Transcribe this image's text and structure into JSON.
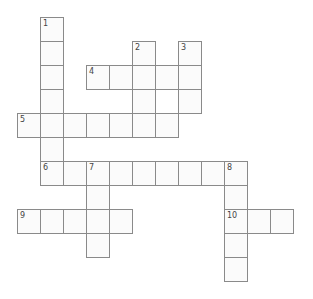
{
  "puzzle": {
    "type": "crossword",
    "cell_width": 23,
    "cell_height": 24,
    "origin_x": 17,
    "origin_y": 17,
    "colors": {
      "cell_fill": "#fbfbfb",
      "cell_border": "#8a8a8a",
      "number_text": "#444444",
      "background": "#ffffff"
    },
    "entries": [
      {
        "number": "1",
        "direction": "down",
        "row": 0,
        "col": 1,
        "length": 7
      },
      {
        "number": "2",
        "direction": "down",
        "row": 1,
        "col": 5,
        "length": 4
      },
      {
        "number": "3",
        "direction": "down",
        "row": 1,
        "col": 7,
        "length": 3
      },
      {
        "number": "4",
        "direction": "across",
        "row": 2,
        "col": 3,
        "length": 5
      },
      {
        "number": "5",
        "direction": "across",
        "row": 4,
        "col": 0,
        "length": 7
      },
      {
        "number": "6",
        "direction": "across",
        "row": 6,
        "col": 1,
        "length": 9
      },
      {
        "number": "7",
        "direction": "down",
        "row": 6,
        "col": 3,
        "length": 4
      },
      {
        "number": "8",
        "direction": "down",
        "row": 6,
        "col": 9,
        "length": 5
      },
      {
        "number": "9",
        "direction": "across",
        "row": 8,
        "col": 0,
        "length": 5
      },
      {
        "number": "10",
        "direction": "across",
        "row": 8,
        "col": 9,
        "length": 3
      }
    ]
  }
}
